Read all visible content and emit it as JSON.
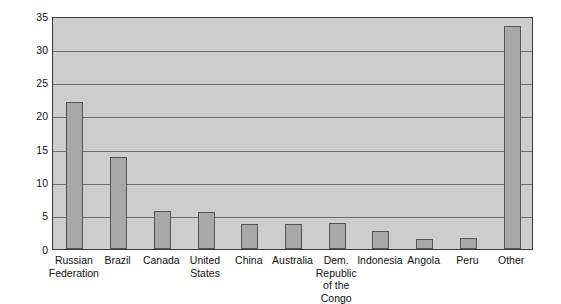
{
  "chart_data": {
    "type": "bar",
    "title": "",
    "xlabel": "",
    "ylabel": "Percent of Total Area",
    "ylim": [
      0,
      35
    ],
    "ytick_step": 5,
    "yticks": [
      "0",
      "5",
      "10",
      "15",
      "20",
      "25",
      "30",
      "35"
    ],
    "grid": true,
    "legend": "none",
    "categories": [
      "Russian\nFederation",
      "Brazil",
      "Canada",
      "United\nStates",
      "China",
      "Australia",
      "Dem.\nRepublic\nof the Congo",
      "Indonesia",
      "Angola",
      "Peru",
      "Other"
    ],
    "values": [
      22.1,
      13.8,
      5.7,
      5.6,
      3.8,
      3.7,
      3.9,
      2.7,
      1.5,
      1.6,
      33.5
    ],
    "colors": {
      "bar_fill": "#a8a8a8",
      "bar_edge": "#555555",
      "plot_background": "#cdcdcd",
      "gridline": "#6e6e6e",
      "frame": "#3a3a3a",
      "text": "#111111",
      "page_background": "#ffffff"
    }
  }
}
